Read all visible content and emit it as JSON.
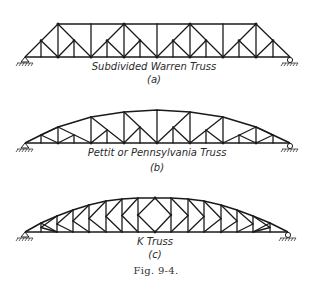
{
  "figure": {
    "caption": "Fig. 9-4.",
    "panels": [
      {
        "id": "a",
        "title": "Subdivided Warren Truss",
        "sublabel": "(a)"
      },
      {
        "id": "b",
        "title": "Pettit or Pennsylvania Truss",
        "sublabel": "(b)"
      },
      {
        "id": "c",
        "title": "K Truss",
        "sublabel": "(c)"
      }
    ]
  },
  "colors": {
    "line": "#1a1a1a",
    "background": "#ffffff"
  }
}
